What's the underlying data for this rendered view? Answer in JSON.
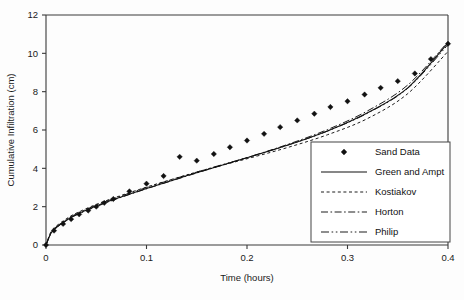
{
  "chart_data": {
    "type": "scatter",
    "title": "",
    "xlabel": "Time (hours)",
    "ylabel": "Cumulative Infiltration (cm)",
    "xlim": [
      0,
      0.4
    ],
    "ylim": [
      0,
      12
    ],
    "xticks": [
      "0",
      "0.1",
      "0.2",
      "0.3",
      "0.4"
    ],
    "xtick_values": [
      0,
      0.1,
      0.2,
      0.3,
      0.4
    ],
    "yticks": [
      "0",
      "2",
      "4",
      "6",
      "8",
      "10",
      "12"
    ],
    "ytick_values": [
      0,
      2,
      4,
      6,
      8,
      10,
      12
    ],
    "grid": false,
    "legend_position": "lower-right",
    "series": [
      {
        "name": "Sand Data",
        "style": "marker",
        "marker": "diamond",
        "x": [
          0.0,
          0.008,
          0.017,
          0.025,
          0.033,
          0.042,
          0.05,
          0.058,
          0.067,
          0.083,
          0.1,
          0.117,
          0.133,
          0.15,
          0.167,
          0.183,
          0.2,
          0.217,
          0.233,
          0.25,
          0.267,
          0.283,
          0.3,
          0.317,
          0.333,
          0.35,
          0.367,
          0.383,
          0.4
        ],
        "y": [
          0.0,
          0.75,
          1.1,
          1.35,
          1.6,
          1.8,
          2.0,
          2.2,
          2.4,
          2.8,
          3.2,
          3.6,
          4.6,
          4.4,
          4.75,
          5.1,
          5.45,
          5.8,
          6.15,
          6.5,
          6.85,
          7.2,
          7.5,
          7.85,
          8.2,
          8.55,
          8.95,
          9.7,
          10.5
        ]
      },
      {
        "name": "Green and Ampt",
        "style": "solid",
        "x": [
          0.0,
          0.005,
          0.01,
          0.02,
          0.03,
          0.05,
          0.07,
          0.1,
          0.13,
          0.16,
          0.2,
          0.24,
          0.28,
          0.32,
          0.36,
          0.4
        ],
        "y": [
          0.0,
          0.62,
          0.9,
          1.28,
          1.58,
          2.03,
          2.42,
          2.95,
          3.45,
          3.93,
          4.55,
          5.2,
          5.95,
          6.9,
          8.2,
          10.55
        ]
      },
      {
        "name": "Kostiakov",
        "style": "dotted",
        "x": [
          0.0,
          0.005,
          0.01,
          0.02,
          0.03,
          0.05,
          0.07,
          0.1,
          0.13,
          0.16,
          0.2,
          0.24,
          0.28,
          0.32,
          0.36,
          0.4
        ],
        "y": [
          0.0,
          0.7,
          0.98,
          1.36,
          1.66,
          2.12,
          2.5,
          3.02,
          3.5,
          3.95,
          4.5,
          5.08,
          5.75,
          6.6,
          7.9,
          10.1
        ]
      },
      {
        "name": "Horton",
        "style": "dashdot",
        "x": [
          0.0,
          0.005,
          0.01,
          0.02,
          0.03,
          0.05,
          0.07,
          0.1,
          0.13,
          0.16,
          0.2,
          0.24,
          0.28,
          0.32,
          0.36,
          0.4
        ],
        "y": [
          0.0,
          0.6,
          0.88,
          1.26,
          1.56,
          2.0,
          2.4,
          2.93,
          3.43,
          3.92,
          4.56,
          5.24,
          6.02,
          7.0,
          8.35,
          10.6
        ]
      },
      {
        "name": "Philip",
        "style": "dashdotdot",
        "x": [
          0.0,
          0.005,
          0.01,
          0.02,
          0.03,
          0.05,
          0.07,
          0.1,
          0.13,
          0.16,
          0.2,
          0.24,
          0.28,
          0.32,
          0.36,
          0.4
        ],
        "y": [
          0.0,
          0.66,
          0.94,
          1.32,
          1.62,
          2.08,
          2.47,
          3.0,
          3.49,
          3.96,
          4.56,
          5.2,
          5.94,
          6.88,
          8.18,
          10.45
        ]
      }
    ]
  },
  "legend": {
    "items": [
      {
        "label": "Sand Data",
        "style": "marker"
      },
      {
        "label": "Green and Ampt",
        "style": "solid"
      },
      {
        "label": "Kostiakov",
        "style": "dotted"
      },
      {
        "label": "Horton",
        "style": "dashdot"
      },
      {
        "label": "Philip",
        "style": "dashdotdot"
      }
    ]
  },
  "colors": {
    "line": "#111111",
    "axis": "#3a3a3a",
    "background": "#fdfdfd",
    "text": "#1a1a1a"
  }
}
